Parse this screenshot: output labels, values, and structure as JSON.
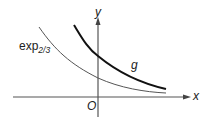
{
  "figure": {
    "axes": {
      "x_label": "x",
      "y_label": "y",
      "origin_label": "O"
    },
    "curves": [
      {
        "name": "g",
        "label": "g",
        "color": "#111111",
        "stroke_width": 2
      },
      {
        "name": "exp_2_3",
        "label_base": "exp",
        "label_subscript": "2/3",
        "color": "#555555",
        "stroke_width": 1
      }
    ],
    "colors": {
      "axis": "#555555",
      "text": "#222222",
      "background": "#ffffff"
    }
  }
}
